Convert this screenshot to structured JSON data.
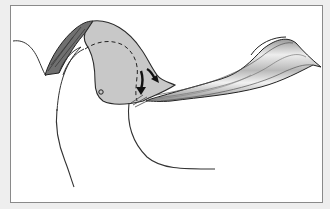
{
  "figure": {
    "type": "anatomical-illustration",
    "caption": ""
  },
  "colors": {
    "background": "#eeeeee",
    "panel": "#ffffff",
    "panel_border": "#8a8a8a",
    "bone_fill": "#c8c8c8",
    "dark_segment_fill": "#6e6e6e",
    "ligament_light": "#e4e4e4",
    "ligament_dark": "#8c8c8c",
    "outline": "#2a2a2a",
    "arrow": "#111111"
  },
  "annotations": {
    "arrows": [
      {
        "name": "downward-arrow",
        "direction": "down"
      },
      {
        "name": "curved-down-right-arrow",
        "direction": "down-right"
      }
    ],
    "markers": [
      {
        "name": "small-circle-marker"
      }
    ],
    "dashed_outline": true
  }
}
